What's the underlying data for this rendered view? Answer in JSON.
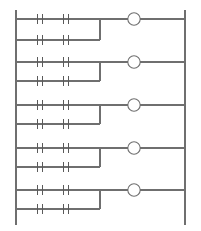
{
  "diagram": {
    "kind": "ladder-logic-diagram",
    "background_color": "#ffffff",
    "line_color": "#6f6f6f",
    "contact_color": "#5a5a5a",
    "canvas": {
      "width": 201,
      "height": 231
    },
    "power_rails": {
      "left": {
        "name": "left-power-rail",
        "x": 16,
        "y_top": 10,
        "y_bottom": 225
      },
      "right": {
        "name": "right-power-rail",
        "x": 185,
        "y_top": 10,
        "y_bottom": 225
      }
    },
    "geometry": {
      "contact_x_positions": [
        40,
        66
      ],
      "contact_gap_half": 2.6,
      "contact_plate_half_height": 5,
      "branch_x": 100,
      "coil_center_x": 134,
      "coil_radius": 6.2
    },
    "rungs": [
      {
        "id": "rung-1",
        "index": 1,
        "top_row_y": 19,
        "bottom_row_y": 40,
        "contacts": [
          {
            "id": "rung-1-contact-1",
            "type": "normally-open",
            "symbol": "-| |-",
            "row": "top",
            "x": 40
          },
          {
            "id": "rung-1-contact-2",
            "type": "normally-open",
            "symbol": "-| |-",
            "row": "top",
            "x": 66
          },
          {
            "id": "rung-1-contact-3",
            "type": "normally-open",
            "symbol": "-| |-",
            "row": "bottom",
            "x": 40
          },
          {
            "id": "rung-1-contact-4",
            "type": "normally-open",
            "symbol": "-| |-",
            "row": "bottom",
            "x": 66
          }
        ],
        "coil": {
          "id": "rung-1-coil",
          "type": "output-coil",
          "shape": "circle",
          "cx": 134,
          "cy": 19
        }
      },
      {
        "id": "rung-2",
        "index": 2,
        "top_row_y": 62,
        "bottom_row_y": 81,
        "contacts": [
          {
            "id": "rung-2-contact-1",
            "type": "normally-open",
            "symbol": "-| |-",
            "row": "top",
            "x": 40
          },
          {
            "id": "rung-2-contact-2",
            "type": "normally-open",
            "symbol": "-| |-",
            "row": "top",
            "x": 66
          },
          {
            "id": "rung-2-contact-3",
            "type": "normally-open",
            "symbol": "-| |-",
            "row": "bottom",
            "x": 40
          },
          {
            "id": "rung-2-contact-4",
            "type": "normally-open",
            "symbol": "-| |-",
            "row": "bottom",
            "x": 66
          }
        ],
        "coil": {
          "id": "rung-2-coil",
          "type": "output-coil",
          "shape": "circle",
          "cx": 134,
          "cy": 62
        }
      },
      {
        "id": "rung-3",
        "index": 3,
        "top_row_y": 105,
        "bottom_row_y": 124,
        "contacts": [
          {
            "id": "rung-3-contact-1",
            "type": "normally-open",
            "symbol": "-| |-",
            "row": "top",
            "x": 40
          },
          {
            "id": "rung-3-contact-2",
            "type": "normally-open",
            "symbol": "-| |-",
            "row": "top",
            "x": 66
          },
          {
            "id": "rung-3-contact-3",
            "type": "normally-open",
            "symbol": "-| |-",
            "row": "bottom",
            "x": 40
          },
          {
            "id": "rung-3-contact-4",
            "type": "normally-open",
            "symbol": "-| |-",
            "row": "bottom",
            "x": 66
          }
        ],
        "coil": {
          "id": "rung-3-coil",
          "type": "output-coil",
          "shape": "circle",
          "cx": 134,
          "cy": 105
        }
      },
      {
        "id": "rung-4",
        "index": 4,
        "top_row_y": 148,
        "bottom_row_y": 167,
        "contacts": [
          {
            "id": "rung-4-contact-1",
            "type": "normally-open",
            "symbol": "-| |-",
            "row": "top",
            "x": 40
          },
          {
            "id": "rung-4-contact-2",
            "type": "normally-open",
            "symbol": "-| |-",
            "row": "top",
            "x": 66
          },
          {
            "id": "rung-4-contact-3",
            "type": "normally-open",
            "symbol": "-| |-",
            "row": "bottom",
            "x": 40
          },
          {
            "id": "rung-4-contact-4",
            "type": "normally-open",
            "symbol": "-| |-",
            "row": "bottom",
            "x": 66
          }
        ],
        "coil": {
          "id": "rung-4-coil",
          "type": "output-coil",
          "shape": "circle",
          "cx": 134,
          "cy": 148
        }
      },
      {
        "id": "rung-5",
        "index": 5,
        "top_row_y": 190,
        "bottom_row_y": 209,
        "contacts": [
          {
            "id": "rung-5-contact-1",
            "type": "normally-open",
            "symbol": "-| |-",
            "row": "top",
            "x": 40
          },
          {
            "id": "rung-5-contact-2",
            "type": "normally-open",
            "symbol": "-| |-",
            "row": "top",
            "x": 66
          },
          {
            "id": "rung-5-contact-3",
            "type": "normally-open",
            "symbol": "-| |-",
            "row": "bottom",
            "x": 40
          },
          {
            "id": "rung-5-contact-4",
            "type": "normally-open",
            "symbol": "-| |-",
            "row": "bottom",
            "x": 66
          }
        ],
        "coil": {
          "id": "rung-5-coil",
          "type": "output-coil",
          "shape": "circle",
          "cx": 134,
          "cy": 190
        }
      }
    ]
  }
}
